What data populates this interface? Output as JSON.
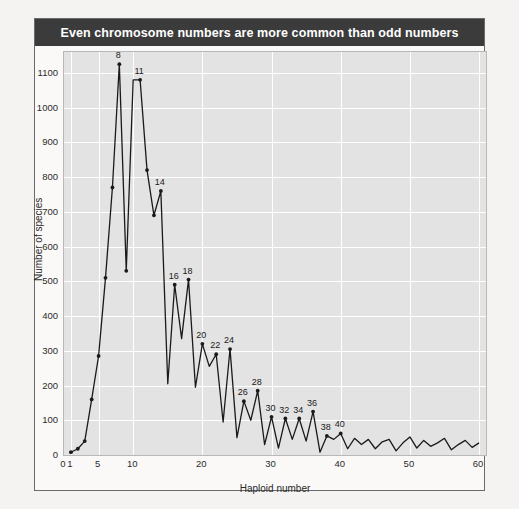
{
  "figure": {
    "title": "Even chromosome numbers are more common than odd numbers",
    "title_background": "#3b3b3b",
    "title_color": "#ffffff",
    "plot_background": "#e3e3e3",
    "grid_color": "#ffffff",
    "line_color": "#1a1a1a",
    "frame_color": "#6a6a6a"
  },
  "chart_data": {
    "type": "line",
    "title": "Even chromosome numbers are more common than odd numbers",
    "xlabel": "Haploid number",
    "ylabel": "Number of species",
    "xlim": [
      0,
      61
    ],
    "ylim": [
      0,
      1160
    ],
    "grid": true,
    "legend": null,
    "xticks": [
      0,
      1,
      5,
      10,
      20,
      30,
      40,
      50,
      60
    ],
    "xtick_labels": [
      "0",
      "1",
      "5",
      "10",
      "20",
      "30",
      "40",
      "50",
      "60"
    ],
    "yticks": [
      0,
      100,
      200,
      300,
      400,
      500,
      600,
      700,
      800,
      900,
      1000,
      1100
    ],
    "ytick_labels": [
      "0",
      "100",
      "200",
      "300",
      "400",
      "500",
      "600",
      "700",
      "800",
      "900",
      "1000",
      "1100"
    ],
    "markers": true,
    "x": [
      1,
      2,
      3,
      4,
      5,
      6,
      7,
      8,
      9,
      10,
      11,
      12,
      13,
      14,
      15,
      16,
      17,
      18,
      19,
      20,
      21,
      22,
      23,
      24,
      25,
      26,
      27,
      28,
      29,
      30,
      31,
      32,
      33,
      34,
      35,
      36,
      37,
      38,
      39,
      40,
      41,
      42,
      43,
      44,
      45,
      46,
      47,
      48,
      49,
      50,
      51,
      52,
      53,
      54,
      55,
      56,
      57,
      58,
      59,
      60
    ],
    "values": [
      8,
      18,
      40,
      160,
      285,
      510,
      770,
      1125,
      530,
      1080,
      1080,
      820,
      690,
      760,
      205,
      490,
      335,
      505,
      195,
      320,
      255,
      290,
      95,
      305,
      50,
      155,
      100,
      185,
      30,
      110,
      20,
      105,
      45,
      105,
      40,
      125,
      8,
      55,
      45,
      62,
      18,
      48,
      30,
      45,
      18,
      38,
      45,
      12,
      35,
      52,
      20,
      42,
      25,
      35,
      48,
      15,
      30,
      42,
      22,
      35
    ],
    "point_labels": [
      {
        "x": 8,
        "label": "8"
      },
      {
        "x": 11,
        "label": "11"
      },
      {
        "x": 14,
        "label": "14"
      },
      {
        "x": 16,
        "label": "16"
      },
      {
        "x": 18,
        "label": "18"
      },
      {
        "x": 20,
        "label": "20"
      },
      {
        "x": 22,
        "label": "22"
      },
      {
        "x": 24,
        "label": "24"
      },
      {
        "x": 26,
        "label": "26"
      },
      {
        "x": 28,
        "label": "28"
      },
      {
        "x": 30,
        "label": "30"
      },
      {
        "x": 32,
        "label": "32"
      },
      {
        "x": 34,
        "label": "34"
      },
      {
        "x": 36,
        "label": "36"
      },
      {
        "x": 38,
        "label": "38"
      },
      {
        "x": 40,
        "label": "40"
      }
    ]
  }
}
